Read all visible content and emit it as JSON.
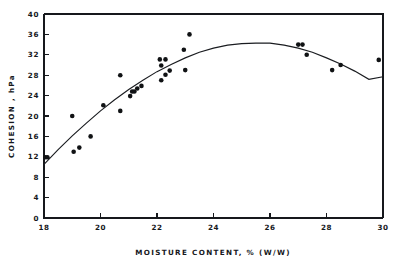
{
  "chart_data": {
    "type": "scatter",
    "title": "",
    "subtitle": "",
    "xlabel": "MOISTURE CONTENT, % (W/W)",
    "ylabel": "COHESION , hPa",
    "xlim": [
      18,
      30
    ],
    "ylim": [
      0,
      40
    ],
    "xticks": [
      18,
      20,
      22,
      24,
      26,
      28,
      30
    ],
    "yticks": [
      0,
      4,
      8,
      12,
      16,
      20,
      24,
      28,
      32,
      36,
      40
    ],
    "xtick_labels": [
      "18",
      "20",
      "22",
      "24",
      "26",
      "28",
      "30"
    ],
    "ytick_labels": [
      "0",
      "4",
      "8",
      "12",
      "16",
      "20",
      "24",
      "28",
      "32",
      "36",
      "40"
    ],
    "grid": false,
    "legend": null,
    "legend_position": "none",
    "marker": "filled-circle",
    "marker_color": "#101214",
    "curve_color": "#1a1c20",
    "points": [
      {
        "x": 18.05,
        "y": 11.9
      },
      {
        "x": 18.12,
        "y": 11.9
      },
      {
        "x": 19.0,
        "y": 20.0
      },
      {
        "x": 19.05,
        "y": 13.0
      },
      {
        "x": 19.25,
        "y": 13.8
      },
      {
        "x": 19.65,
        "y": 16.0
      },
      {
        "x": 20.1,
        "y": 22.1
      },
      {
        "x": 20.7,
        "y": 28.0
      },
      {
        "x": 20.7,
        "y": 21.0
      },
      {
        "x": 21.05,
        "y": 23.9
      },
      {
        "x": 21.12,
        "y": 24.8
      },
      {
        "x": 21.2,
        "y": 24.8
      },
      {
        "x": 21.3,
        "y": 25.4
      },
      {
        "x": 21.45,
        "y": 25.9
      },
      {
        "x": 22.1,
        "y": 31.1
      },
      {
        "x": 22.15,
        "y": 29.9
      },
      {
        "x": 22.15,
        "y": 27.0
      },
      {
        "x": 22.3,
        "y": 31.1
      },
      {
        "x": 22.3,
        "y": 28.1
      },
      {
        "x": 22.45,
        "y": 28.9
      },
      {
        "x": 22.95,
        "y": 33.0
      },
      {
        "x": 23.0,
        "y": 29.0
      },
      {
        "x": 23.15,
        "y": 36.0
      },
      {
        "x": 27.0,
        "y": 34.0
      },
      {
        "x": 27.15,
        "y": 34.0
      },
      {
        "x": 27.3,
        "y": 32.0
      },
      {
        "x": 28.2,
        "y": 29.0
      },
      {
        "x": 28.5,
        "y": 30.0
      },
      {
        "x": 29.85,
        "y": 31.0
      }
    ],
    "fit_curve": {
      "description": "quadratic fit peaking near 25.8",
      "peak_x": 25.8,
      "peak_y": 34.3,
      "samples": [
        {
          "x": 18.0,
          "y": 10.5
        },
        {
          "x": 18.5,
          "y": 13.4
        },
        {
          "x": 19.0,
          "y": 16.1
        },
        {
          "x": 19.5,
          "y": 18.6
        },
        {
          "x": 20.0,
          "y": 21.0
        },
        {
          "x": 20.5,
          "y": 23.2
        },
        {
          "x": 21.0,
          "y": 25.2
        },
        {
          "x": 21.5,
          "y": 27.0
        },
        {
          "x": 22.0,
          "y": 28.7
        },
        {
          "x": 22.5,
          "y": 30.1
        },
        {
          "x": 23.0,
          "y": 31.4
        },
        {
          "x": 23.5,
          "y": 32.5
        },
        {
          "x": 24.0,
          "y": 33.3
        },
        {
          "x": 24.5,
          "y": 33.9
        },
        {
          "x": 25.0,
          "y": 34.2
        },
        {
          "x": 25.5,
          "y": 34.3
        },
        {
          "x": 26.0,
          "y": 34.3
        },
        {
          "x": 26.5,
          "y": 33.9
        },
        {
          "x": 27.0,
          "y": 33.3
        },
        {
          "x": 27.5,
          "y": 32.5
        },
        {
          "x": 28.0,
          "y": 31.4
        },
        {
          "x": 28.5,
          "y": 30.2
        },
        {
          "x": 29.0,
          "y": 28.8
        },
        {
          "x": 29.5,
          "y": 27.2
        },
        {
          "x": 30.0,
          "y": 27.7
        }
      ]
    }
  }
}
